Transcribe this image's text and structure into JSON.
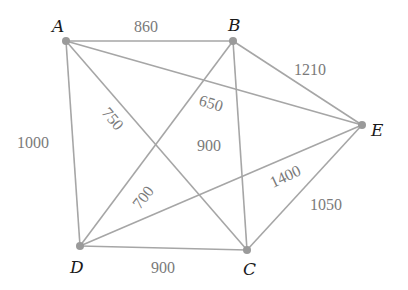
{
  "graph": {
    "nodes": [
      {
        "id": "A",
        "label": "A",
        "x": 66,
        "y": 41
      },
      {
        "id": "B",
        "label": "B",
        "x": 233,
        "y": 41
      },
      {
        "id": "E",
        "label": "E",
        "x": 362,
        "y": 125
      },
      {
        "id": "D",
        "label": "D",
        "x": 80,
        "y": 246
      },
      {
        "id": "C",
        "label": "C",
        "x": 247,
        "y": 250
      }
    ],
    "edges": [
      {
        "from": "A",
        "to": "B",
        "weight": "860"
      },
      {
        "from": "A",
        "to": "D",
        "weight": "1000"
      },
      {
        "from": "A",
        "to": "C",
        "weight": "750"
      },
      {
        "from": "A",
        "to": "E",
        "weight": "650"
      },
      {
        "from": "B",
        "to": "E",
        "weight": "1210"
      },
      {
        "from": "B",
        "to": "C",
        "weight": "900"
      },
      {
        "from": "B",
        "to": "D",
        "weight": "700"
      },
      {
        "from": "D",
        "to": "C",
        "weight": "900"
      },
      {
        "from": "D",
        "to": "E",
        "weight": "1400"
      },
      {
        "from": "C",
        "to": "E",
        "weight": "1050"
      }
    ]
  }
}
